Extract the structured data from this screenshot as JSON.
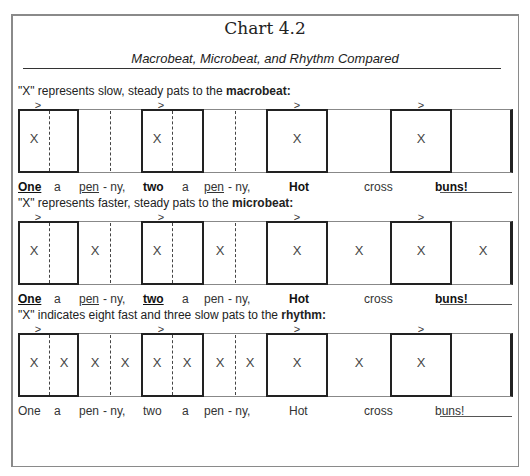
{
  "title": "Chart 4.2",
  "subtitle": "Macrobeat, Microbeat, and Rhythm Compared",
  "sections": [
    {
      "caption_prefix": "\"X\" represents slow, steady pats to the ",
      "caption_bold": "macrobeat:",
      "accent_symbol": ">",
      "marks": [
        "X",
        "",
        "",
        "",
        "X",
        "",
        "",
        "",
        "X",
        "",
        "X",
        ""
      ],
      "lyrics": [
        {
          "text": "One",
          "bold": true,
          "underline": true
        },
        {
          "text": "a",
          "bold": false,
          "underline": false
        },
        {
          "text": "pen",
          "bold": false,
          "underline": true
        },
        {
          "text": "- ny,",
          "bold": false,
          "underline": false
        },
        {
          "text": "two",
          "bold": true,
          "underline": false
        },
        {
          "text": "a",
          "bold": false,
          "underline": false
        },
        {
          "text": "pen",
          "bold": false,
          "underline": true
        },
        {
          "text": "- ny,",
          "bold": false,
          "underline": false
        },
        {
          "text": "Hot",
          "bold": true,
          "underline": false
        },
        {
          "text": "cross",
          "bold": false,
          "underline": false
        },
        {
          "text": "buns!",
          "bold": true,
          "underline": false
        }
      ]
    },
    {
      "caption_prefix": "\"X\" represents faster, steady pats to the ",
      "caption_bold": "microbeat:",
      "accent_symbol": ">",
      "marks": [
        "X",
        "",
        "X",
        "",
        "X",
        "",
        "X",
        "",
        "X",
        "X",
        "X",
        "X"
      ],
      "lyrics": [
        {
          "text": "One",
          "bold": true,
          "underline": true
        },
        {
          "text": "a",
          "bold": false,
          "underline": false
        },
        {
          "text": "pen",
          "bold": false,
          "underline": true
        },
        {
          "text": "- ny,",
          "bold": false,
          "underline": false
        },
        {
          "text": "two",
          "bold": true,
          "underline": true
        },
        {
          "text": "a",
          "bold": false,
          "underline": false
        },
        {
          "text": "pen",
          "bold": false,
          "underline": false
        },
        {
          "text": "- ny,",
          "bold": false,
          "underline": false
        },
        {
          "text": "Hot",
          "bold": true,
          "underline": false
        },
        {
          "text": "cross",
          "bold": false,
          "underline": false
        },
        {
          "text": "buns!",
          "bold": true,
          "underline": false
        }
      ]
    },
    {
      "caption_prefix": "\"X\" indicates eight fast and three slow pats to the ",
      "caption_bold": "rhythm:",
      "accent_symbol": ">",
      "marks": [
        "X",
        "X",
        "X",
        "X",
        "X",
        "X",
        "X",
        "X",
        "X",
        "X",
        "X",
        ""
      ],
      "lyrics": [
        {
          "text": "One",
          "bold": false,
          "underline": false
        },
        {
          "text": "a",
          "bold": false,
          "underline": false
        },
        {
          "text": "pen",
          "bold": false,
          "underline": false
        },
        {
          "text": "- ny,",
          "bold": false,
          "underline": false
        },
        {
          "text": "two",
          "bold": false,
          "underline": false
        },
        {
          "text": "a",
          "bold": false,
          "underline": false
        },
        {
          "text": "pen",
          "bold": false,
          "underline": false
        },
        {
          "text": "- ny,",
          "bold": false,
          "underline": false
        },
        {
          "text": "Hot",
          "bold": false,
          "underline": false
        },
        {
          "text": "cross",
          "bold": false,
          "underline": false
        },
        {
          "text": "buns!",
          "bold": false,
          "underline": false
        }
      ]
    }
  ]
}
